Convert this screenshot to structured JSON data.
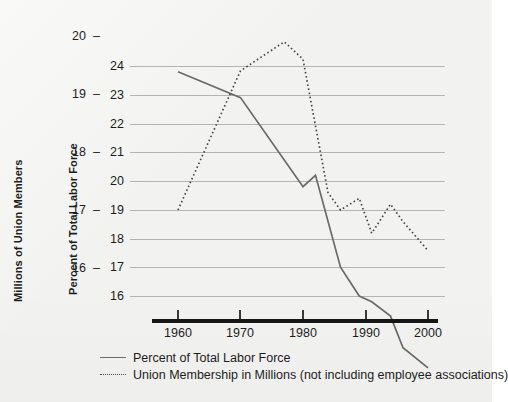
{
  "chart_data": {
    "type": "line",
    "title": "",
    "xlabel": "",
    "x_ticks": [
      "1960",
      "1970",
      "1980",
      "1990",
      "2000"
    ],
    "xlim": [
      1960,
      2000
    ],
    "grid": true,
    "legend_position": "bottom-left",
    "axes": {
      "left": {
        "label": "Millions of Union Members",
        "ticks": [
          "20",
          "19",
          "18",
          "17",
          "16"
        ],
        "tick_values": [
          20,
          19,
          18,
          17,
          16
        ],
        "tick_dash": "–",
        "ylim": [
          15.5,
          20.3
        ]
      },
      "right": {
        "label": "Percent of Total Labor Force",
        "ticks": [
          "24",
          "23",
          "22",
          "21",
          "20",
          "19",
          "18",
          "17",
          "16"
        ],
        "tick_values": [
          24,
          23,
          22,
          21,
          20,
          19,
          18,
          17,
          16
        ],
        "ylim": [
          15.2,
          24.4
        ]
      }
    },
    "series": [
      {
        "name": "Percent of Total Labor Force",
        "style": "solid",
        "color": "#6a6a6a",
        "axis": "right",
        "units": "percent",
        "x": [
          1960,
          1970,
          1980,
          1982,
          1986,
          1989,
          1991,
          1994,
          1996,
          2000
        ],
        "values": [
          23.8,
          22.9,
          19.8,
          20.2,
          17.0,
          16.0,
          15.8,
          15.3,
          14.2,
          13.5
        ]
      },
      {
        "name": "Union Membership in Millions (not including employee associations)",
        "style": "dotted",
        "color": "#4a4a4a",
        "axis": "left",
        "units": "millions",
        "x": [
          1960,
          1970,
          1977,
          1980,
          1984,
          1986,
          1989,
          1991,
          1994,
          1996,
          2000
        ],
        "values": [
          17.0,
          19.4,
          19.9,
          19.6,
          17.3,
          17.0,
          17.2,
          16.6,
          17.1,
          16.8,
          16.3
        ]
      }
    ]
  },
  "legend": {
    "items": [
      {
        "label": "Percent of Total Labor Force",
        "style": "solid"
      },
      {
        "label": "Union Membership in Millions (not including employee associations)",
        "style": "dotted"
      }
    ]
  }
}
